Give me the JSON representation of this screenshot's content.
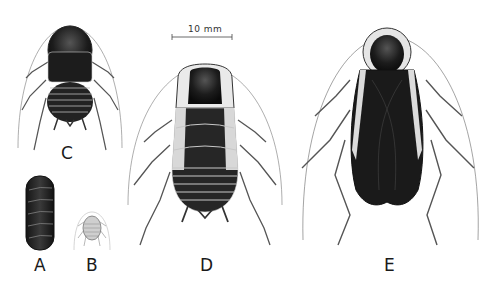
{
  "figure": {
    "scale_bar": {
      "label": "10 mm"
    },
    "specimens": [
      {
        "id": "A",
        "label": "A",
        "description": "ootheca (egg case)"
      },
      {
        "id": "B",
        "label": "B",
        "description": "first instar nymph"
      },
      {
        "id": "C",
        "label": "C",
        "description": "small nymph"
      },
      {
        "id": "D",
        "label": "D",
        "description": "late instar nymph"
      },
      {
        "id": "E",
        "label": "E",
        "description": "adult"
      }
    ],
    "colors": {
      "ink": "#1a1a1a",
      "shade": "#3a3a3a",
      "pale": "#e8e8e8",
      "background": "#ffffff"
    }
  }
}
